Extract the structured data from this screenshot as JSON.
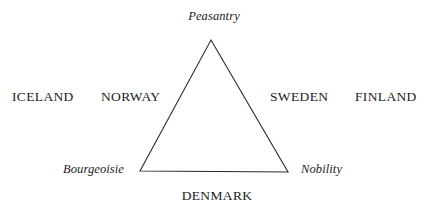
{
  "figure": {
    "background_color": "#ffffff",
    "line_color": "#2b2b2b",
    "text_color": "#1c1c1c",
    "width": 432,
    "height": 218
  },
  "diagram": {
    "shape": "triangle",
    "vertices": {
      "apex": {
        "x": 211,
        "y": 40,
        "label": "Peasantry"
      },
      "bottom_left": {
        "x": 140,
        "y": 171,
        "label": "Bourgeoisie"
      },
      "bottom_right": {
        "x": 288,
        "y": 172,
        "label": "Nobility"
      }
    },
    "estate_labels": [
      {
        "id": "peasantry",
        "text": "Peasantry",
        "style": "italic",
        "position": "above-apex"
      },
      {
        "id": "bourgeoisie",
        "text": "Bourgeoisie",
        "style": "italic",
        "position": "left-of-bottom-left-vertex"
      },
      {
        "id": "nobility",
        "text": "Nobility",
        "style": "italic",
        "position": "right-of-bottom-right-vertex"
      }
    ],
    "country_labels": [
      {
        "id": "iceland",
        "text": "ICELAND",
        "side": "left-outer"
      },
      {
        "id": "norway",
        "text": "NORWAY",
        "side": "left-inner"
      },
      {
        "id": "sweden",
        "text": "SWEDEN",
        "side": "right-inner"
      },
      {
        "id": "finland",
        "text": "FINLAND",
        "side": "right-outer"
      },
      {
        "id": "denmark",
        "text": "DENMARK",
        "side": "bottom-center"
      }
    ]
  }
}
